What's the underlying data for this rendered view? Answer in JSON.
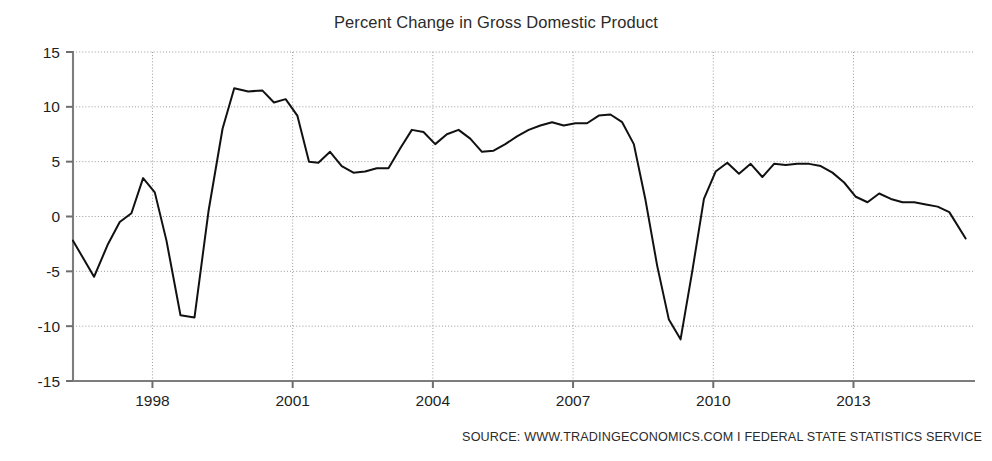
{
  "chart_data": {
    "type": "line",
    "title": "Percent Change in Gross Domestic Product",
    "xlabel": "",
    "ylabel": "",
    "ylim": [
      -15,
      15
    ],
    "xlim": [
      1996.3,
      2015.6
    ],
    "yticks": [
      15,
      10,
      5,
      0,
      -5,
      -10,
      -15
    ],
    "ytick_labels": [
      "15",
      "10",
      "5",
      "0",
      "-5",
      "-10",
      "-15"
    ],
    "xticks": [
      1998,
      2001,
      2004,
      2007,
      2010,
      2013
    ],
    "xtick_labels": [
      "1998",
      "2001",
      "2004",
      "2007",
      "2010",
      "2013"
    ],
    "grid": true,
    "grid_style": "dotted",
    "legend": "none",
    "line_color": "#111111",
    "line_width": 2.0,
    "series": [
      {
        "name": "Percent Change in GDP",
        "x": [
          1996.3,
          1996.75,
          1997.05,
          1997.3,
          1997.55,
          1997.8,
          1998.05,
          1998.3,
          1998.6,
          1998.9,
          1999.2,
          1999.5,
          1999.75,
          2000.05,
          2000.35,
          2000.6,
          2000.85,
          2001.1,
          2001.35,
          2001.55,
          2001.8,
          2002.05,
          2002.3,
          2002.55,
          2002.8,
          2003.05,
          2003.3,
          2003.55,
          2003.8,
          2004.05,
          2004.3,
          2004.55,
          2004.8,
          2005.05,
          2005.3,
          2005.55,
          2005.8,
          2006.05,
          2006.3,
          2006.55,
          2006.8,
          2007.05,
          2007.3,
          2007.55,
          2007.8,
          2008.05,
          2008.3,
          2008.55,
          2008.8,
          2009.05,
          2009.3,
          2009.55,
          2009.8,
          2010.05,
          2010.3,
          2010.55,
          2010.8,
          2011.05,
          2011.3,
          2011.55,
          2011.8,
          2012.05,
          2012.3,
          2012.55,
          2012.8,
          2013.05,
          2013.3,
          2013.55,
          2013.8,
          2014.05,
          2014.3,
          2014.55,
          2014.8,
          2015.05,
          2015.4
        ],
        "y": [
          -2.2,
          -5.5,
          -2.5,
          -0.5,
          0.3,
          3.5,
          2.2,
          -2.2,
          -9.0,
          -9.2,
          0.5,
          8.0,
          11.7,
          11.4,
          11.5,
          10.4,
          10.7,
          9.2,
          5.0,
          4.9,
          5.9,
          4.6,
          4.0,
          4.1,
          4.4,
          4.4,
          6.2,
          7.9,
          7.7,
          6.6,
          7.5,
          7.9,
          7.1,
          5.9,
          6.0,
          6.6,
          7.3,
          7.9,
          8.3,
          8.6,
          8.3,
          8.5,
          8.5,
          9.2,
          9.3,
          8.6,
          6.6,
          1.5,
          -4.5,
          -9.4,
          -11.2,
          -5.0,
          1.6,
          4.1,
          4.9,
          3.9,
          4.8,
          3.6,
          4.8,
          4.7,
          4.8,
          4.8,
          4.6,
          4.0,
          3.1,
          1.8,
          1.3,
          2.1,
          1.6,
          1.3,
          1.3,
          1.1,
          0.9,
          0.4,
          -2.0
        ]
      }
    ]
  },
  "footer": {
    "source": "SOURCE: WWW.TRADINGECONOMICS.COM  I  FEDERAL STATE STATISTICS SERVICE"
  }
}
